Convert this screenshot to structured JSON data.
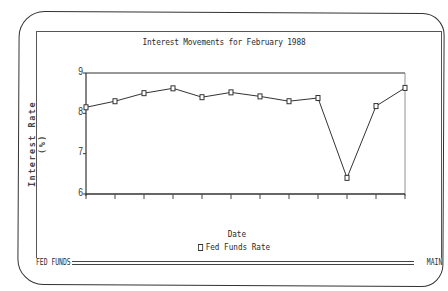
{
  "status_bar": {
    "left_label": "FED FUNDS",
    "right_label": "MAIN"
  },
  "chart_data": {
    "type": "line",
    "title": "Interest Movements for February 1988",
    "xlabel": "Date",
    "ylabel": "Interest Rate (%)",
    "ylim": [
      6,
      9
    ],
    "yticks": [
      6,
      7,
      8,
      9
    ],
    "grid": false,
    "legend_position": "bottom-center",
    "x": [
      1,
      2,
      3,
      4,
      5,
      6,
      7,
      8,
      9,
      10,
      11,
      12
    ],
    "series": [
      {
        "name": "Fed Funds Rate",
        "marker": "square",
        "values": [
          8.15,
          8.3,
          8.5,
          8.62,
          8.4,
          8.52,
          8.42,
          8.3,
          8.38,
          6.4,
          8.18,
          8.63
        ]
      }
    ]
  }
}
